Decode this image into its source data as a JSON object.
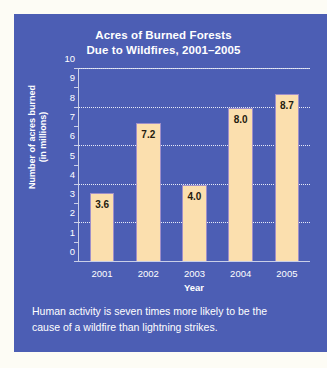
{
  "chart_data": {
    "type": "bar",
    "title": "Acres of Burned Forests Due to Wildfires, 2001–2005",
    "title_lines": [
      "Acres of Burned Forests",
      "Due to Wildfires, 2001–2005"
    ],
    "categories": [
      "2001",
      "2002",
      "2003",
      "2004",
      "2005"
    ],
    "values": [
      3.6,
      7.2,
      4.0,
      8.0,
      8.7
    ],
    "value_labels": [
      "3.6",
      "7.2",
      "4.0",
      "8.0",
      "8.7"
    ],
    "xlabel": "Year",
    "ylabel": "Number of acres burned (in millions)",
    "ylabel_lines": [
      "Number of acres burned",
      "(in millions)"
    ],
    "ylim": [
      0,
      10
    ],
    "ytick_values": [
      0,
      1,
      2,
      3,
      4,
      5,
      6,
      7,
      8,
      9,
      10
    ],
    "ytick_labels": [
      "0",
      "1",
      "2",
      "3",
      "4",
      "5",
      "6",
      "7",
      "8",
      "9",
      "10"
    ],
    "gridlines_at": [
      2,
      4,
      6,
      8,
      10
    ],
    "grid": "horizontal-dotted",
    "legend": "none",
    "colors": {
      "panel_background": "#4c5eb4",
      "bar_fill": "#fbdfae",
      "bar_border": "#9f8fc9",
      "axis": "#c9cfe8",
      "gridline": "#e8ebf7",
      "text": "#ffffff",
      "value_label_text": "#241c0e",
      "frame": "#fdfcf5"
    }
  },
  "caption": {
    "text": "Human activity is seven times more likely to be the cause of a wildfire than lightning strikes."
  }
}
